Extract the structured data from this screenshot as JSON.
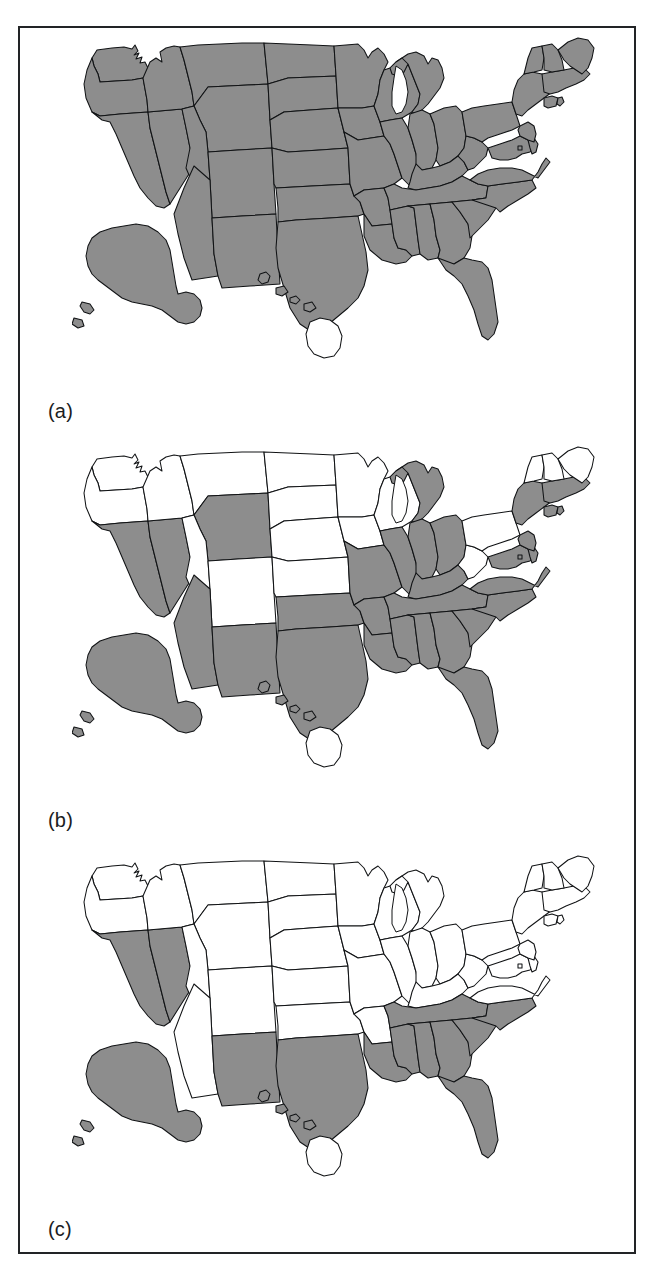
{
  "figure": {
    "type": "choropleth-map-series",
    "region": "United States",
    "panel_count": 3,
    "fill_colors": {
      "shaded": "#8d8d8d",
      "unshaded": "#ffffff",
      "outline": "#111315",
      "frame": "#222426"
    },
    "projection_note": "Albers-style US map with Alaska and Hawaii insets placed below the lower-48",
    "panels": [
      {
        "id": "a",
        "label": "(a)",
        "shaded_count": 51,
        "shaded": [
          "AL",
          "AK",
          "AZ",
          "AR",
          "CA",
          "CO",
          "CT",
          "DE",
          "FL",
          "GA",
          "ID",
          "IL",
          "IN",
          "IA",
          "KS",
          "KY",
          "LA",
          "ME",
          "MD",
          "MA",
          "MI",
          "MN",
          "MS",
          "MO",
          "MT",
          "NE",
          "NV",
          "NH",
          "NJ",
          "NM",
          "NY",
          "NC",
          "ND",
          "OH",
          "OK",
          "OR",
          "PA",
          "RI",
          "SC",
          "SD",
          "TN",
          "TX",
          "UT",
          "VT",
          "VA",
          "WA",
          "WV",
          "WI",
          "WY",
          "DC",
          "HI-minor"
        ],
        "unshaded": [
          "HI-bigisland"
        ]
      },
      {
        "id": "b",
        "label": "(b)",
        "shaded_count": 33,
        "shaded": [
          "AL",
          "AK",
          "AZ",
          "AR",
          "CA",
          "CT",
          "DE",
          "FL",
          "GA",
          "IL",
          "IN",
          "KY",
          "LA",
          "MD",
          "MA",
          "MI",
          "MS",
          "MO",
          "NV",
          "NJ",
          "NM",
          "NY",
          "NC",
          "OH",
          "OK",
          "RI",
          "SC",
          "TN",
          "TX",
          "VA",
          "WY",
          "DC",
          "HI-minor"
        ],
        "unshaded": [
          "CO",
          "ID",
          "IA",
          "KS",
          "ME",
          "MN",
          "MT",
          "NE",
          "NH",
          "ND",
          "OR",
          "PA",
          "SD",
          "UT",
          "VT",
          "WA",
          "WV",
          "WI",
          "HI-bigisland"
        ]
      },
      {
        "id": "c",
        "label": "(c)",
        "shaded_count": 13,
        "shaded": [
          "AL",
          "AK",
          "CA",
          "FL",
          "GA",
          "LA",
          "MS",
          "NV",
          "NM",
          "NC",
          "SC",
          "TN",
          "TX",
          "HI-minor"
        ],
        "unshaded": [
          "AZ",
          "AR",
          "CO",
          "CT",
          "DE",
          "ID",
          "IL",
          "IN",
          "IA",
          "KS",
          "KY",
          "ME",
          "MD",
          "MA",
          "MI",
          "MN",
          "MO",
          "MT",
          "NE",
          "NH",
          "NJ",
          "NY",
          "ND",
          "OH",
          "OK",
          "OR",
          "PA",
          "RI",
          "SD",
          "UT",
          "VT",
          "VA",
          "WA",
          "WV",
          "WI",
          "WY",
          "DC",
          "HI-bigisland"
        ]
      }
    ]
  }
}
